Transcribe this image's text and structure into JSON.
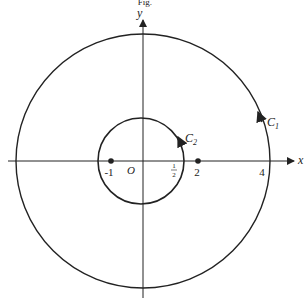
{
  "figure": {
    "caption_partial": "Fig.",
    "axes": {
      "x_label": "x",
      "y_label": "y",
      "origin_label": "O"
    },
    "curves": [
      {
        "name": "C",
        "subscript": "1",
        "label": "C1",
        "center": [
          0,
          0
        ],
        "radius": 4,
        "orientation": "counterclockwise"
      },
      {
        "name": "C",
        "subscript": "2",
        "label": "C2",
        "center": [
          0,
          0
        ],
        "radius": 0.5,
        "orientation": "counterclockwise"
      }
    ],
    "points": [
      {
        "label": "-1",
        "x": -1
      },
      {
        "label": "2",
        "x": 2
      }
    ],
    "tick_labels": [
      {
        "label": "1/2",
        "num": "1",
        "den": "2",
        "x": 0.5
      },
      {
        "label": "4",
        "x": 4
      }
    ],
    "colors": {
      "stroke": "#222222",
      "background": "#ffffff"
    }
  }
}
